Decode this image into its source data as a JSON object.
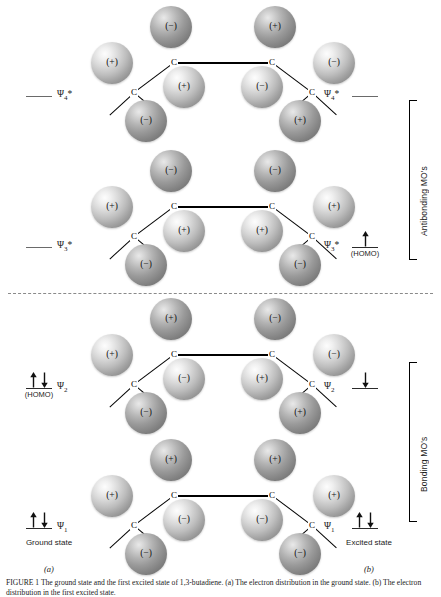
{
  "figure": {
    "caption": "FIGURE 1 The ground state and the first excited state of 1,3-butadiene. (a) The electron distribution in the ground state. (b) The electron distribution in the first excited state.",
    "separator_present": true,
    "atom_symbol": "C",
    "sign_positive": "(+)",
    "sign_negative": "(−)"
  },
  "left_column": {
    "heading": "Ground state",
    "panel_letter": "(a)",
    "levels": [
      {
        "psi": "Ψ4*",
        "psi_base": "Ψ",
        "psi_sub": "4",
        "psi_star": "*",
        "note": "",
        "electrons": []
      },
      {
        "psi": "Ψ3*",
        "psi_base": "Ψ",
        "psi_sub": "3",
        "psi_star": "*",
        "note": "",
        "electrons": []
      },
      {
        "psi": "Ψ2",
        "psi_base": "Ψ",
        "psi_sub": "2",
        "psi_star": "",
        "note": "(HOMO)",
        "electrons": [
          "up",
          "down"
        ]
      },
      {
        "psi": "Ψ1",
        "psi_base": "Ψ",
        "psi_sub": "1",
        "psi_star": "",
        "note": "",
        "electrons": [
          "up",
          "down"
        ]
      }
    ]
  },
  "right_column": {
    "heading": "Excited state",
    "panel_letter": "(b)",
    "levels": [
      {
        "psi": "Ψ4*",
        "psi_base": "Ψ",
        "psi_sub": "4",
        "psi_star": "*",
        "note": "",
        "electrons": []
      },
      {
        "psi": "Ψ3*",
        "psi_base": "Ψ",
        "psi_sub": "3",
        "psi_star": "*",
        "note": "(HOMO)",
        "electrons": [
          "up"
        ]
      },
      {
        "psi": "Ψ2",
        "psi_base": "Ψ",
        "psi_sub": "2",
        "psi_star": "",
        "note": "",
        "electrons": [
          "down"
        ]
      },
      {
        "psi": "Ψ1",
        "psi_base": "Ψ",
        "psi_sub": "1",
        "psi_star": "",
        "note": "",
        "electrons": [
          "up",
          "down"
        ]
      }
    ]
  },
  "braces": [
    {
      "label": "Antibonding MO's",
      "covers": [
        "Ψ4*",
        "Ψ3*"
      ]
    },
    {
      "label": "Bonding MO's",
      "covers": [
        "Ψ2",
        "Ψ1"
      ]
    }
  ],
  "orbitals": [
    {
      "name": "psi-4-star",
      "psi": "Ψ4*",
      "nodes": 3,
      "lobes": [
        {
          "pos": "c1-top",
          "sign": "(+)"
        },
        {
          "pos": "c1-bottom",
          "sign": "(−)"
        },
        {
          "pos": "c2-top",
          "sign": "(−)"
        },
        {
          "pos": "c2-bottom",
          "sign": "(+)"
        },
        {
          "pos": "c3-top",
          "sign": "(+)"
        },
        {
          "pos": "c3-bottom",
          "sign": "(−)"
        },
        {
          "pos": "c4-top",
          "sign": "(−)"
        },
        {
          "pos": "c4-bottom",
          "sign": "(+)"
        }
      ]
    },
    {
      "name": "psi-3-star",
      "psi": "Ψ3*",
      "nodes": 2,
      "lobes": [
        {
          "pos": "c1-top",
          "sign": "(+)"
        },
        {
          "pos": "c1-bottom",
          "sign": "(−)"
        },
        {
          "pos": "c2-top",
          "sign": "(−)"
        },
        {
          "pos": "c2-bottom",
          "sign": "(+)"
        },
        {
          "pos": "c3-top",
          "sign": "(−)"
        },
        {
          "pos": "c3-bottom",
          "sign": "(+)"
        },
        {
          "pos": "c4-top",
          "sign": "(+)"
        },
        {
          "pos": "c4-bottom",
          "sign": "(−)"
        }
      ]
    },
    {
      "name": "psi-2",
      "psi": "Ψ2",
      "nodes": 1,
      "lobes": [
        {
          "pos": "c1-top",
          "sign": "(+)"
        },
        {
          "pos": "c1-bottom",
          "sign": "(−)"
        },
        {
          "pos": "c2-top",
          "sign": "(+)"
        },
        {
          "pos": "c2-bottom",
          "sign": "(−)"
        },
        {
          "pos": "c3-top",
          "sign": "(−)"
        },
        {
          "pos": "c3-bottom",
          "sign": "(+)"
        },
        {
          "pos": "c4-top",
          "sign": "(−)"
        },
        {
          "pos": "c4-bottom",
          "sign": "(+)"
        }
      ]
    },
    {
      "name": "psi-1",
      "psi": "Ψ1",
      "nodes": 0,
      "lobes": [
        {
          "pos": "c1-top",
          "sign": "(+)"
        },
        {
          "pos": "c1-bottom",
          "sign": "(−)"
        },
        {
          "pos": "c2-top",
          "sign": "(+)"
        },
        {
          "pos": "c2-bottom",
          "sign": "(−)"
        },
        {
          "pos": "c3-top",
          "sign": "(+)"
        },
        {
          "pos": "c3-bottom",
          "sign": "(−)"
        },
        {
          "pos": "c4-top",
          "sign": "(+)"
        },
        {
          "pos": "c4-bottom",
          "sign": "(−)"
        }
      ]
    }
  ]
}
